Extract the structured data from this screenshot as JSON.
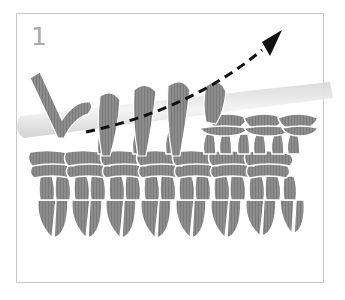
{
  "figure": {
    "step_number": "1",
    "elements": {
      "hook": "crochet-hook",
      "arrow": "direction-arrow",
      "stitches": "stitch-rows"
    }
  },
  "colors": {
    "frame_border": "#c8c8c8",
    "step_number": "#a9a9a9",
    "yarn": "#8a8a8a",
    "yarn_dark": "#6e6e6e",
    "hook": "#e6e6e6",
    "arrow": "#111111"
  }
}
